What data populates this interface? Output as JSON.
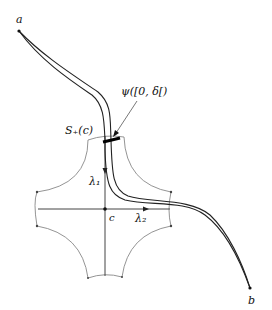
{
  "diagram": {
    "labels": {
      "a": "a",
      "b": "b",
      "c": "c",
      "S_plus": "S₊(c)",
      "psi": "ψ([0, δ[)",
      "lambda1": "λ₁",
      "lambda2": "λ₂"
    },
    "colors": {
      "curve": "#222222",
      "region": "#777777",
      "axis": "#333333",
      "background": "#ffffff"
    }
  }
}
